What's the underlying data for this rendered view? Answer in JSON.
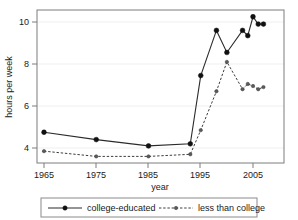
{
  "chart_data": {
    "type": "line",
    "title": "",
    "xlabel": "year",
    "ylabel": "hours per week",
    "xlim": [
      1963,
      2009
    ],
    "ylim": [
      3.2,
      10.7
    ],
    "xticks": [
      1965,
      1975,
      1985,
      1995,
      2005
    ],
    "yticks": [
      4,
      6,
      8,
      10
    ],
    "grid": "horizontal-light",
    "legend_position": "below-plot",
    "series": [
      {
        "name": "college-educated",
        "style": "solid",
        "marker": "filled-circle",
        "color": "#2b2b2b",
        "x": [
          1965,
          1975,
          1985,
          1993,
          1995,
          1998,
          2000,
          2003,
          2004,
          2005,
          2006,
          2007
        ],
        "values": [
          4.75,
          4.4,
          4.1,
          4.2,
          7.45,
          9.6,
          8.55,
          9.6,
          9.35,
          10.25,
          9.9,
          9.9
        ]
      },
      {
        "name": "less than college",
        "style": "dashed",
        "marker": "small-circle",
        "color": "#3d3d3d",
        "x": [
          1965,
          1975,
          1985,
          1993,
          1995,
          1998,
          2000,
          2003,
          2004,
          2005,
          2006,
          2007
        ],
        "values": [
          3.85,
          3.6,
          3.6,
          3.7,
          4.85,
          6.7,
          8.1,
          6.8,
          7.05,
          6.95,
          6.8,
          6.9
        ]
      }
    ]
  },
  "axes": {
    "y_title": "hours per week",
    "x_title": "year",
    "y_tick_labels": [
      "10",
      "8",
      "6",
      "4"
    ],
    "x_tick_labels": [
      "1965",
      "1975",
      "1985",
      "1995",
      "2005"
    ]
  },
  "legend": {
    "entries": [
      {
        "label": "college-educated"
      },
      {
        "label": "less than college"
      }
    ]
  }
}
